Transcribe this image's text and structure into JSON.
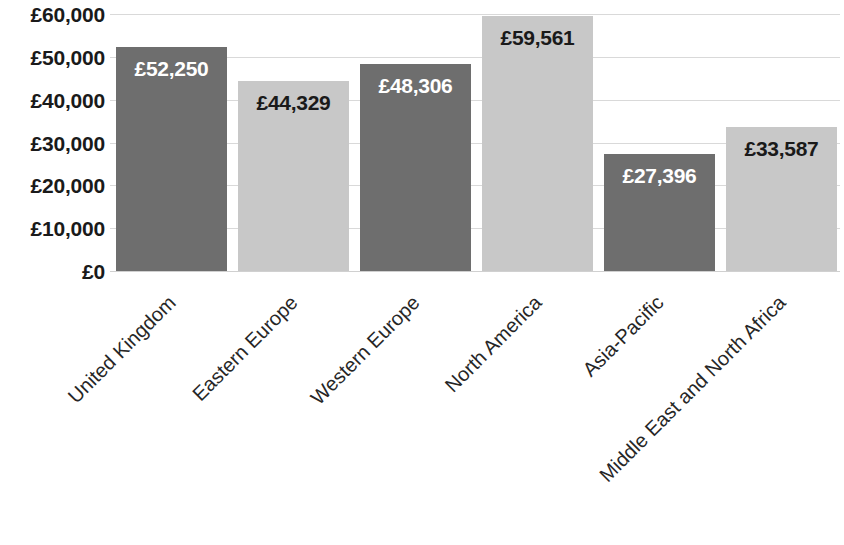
{
  "chart_data": {
    "type": "bar",
    "title": "",
    "subtitle": "",
    "xlabel": "",
    "ylabel": "",
    "categories": [
      "United Kingdom",
      "Eastern Europe",
      "Western Europe",
      "North America",
      "Asia-Pacific",
      "Middle East and North Africa"
    ],
    "values": [
      52250,
      44329,
      48306,
      59561,
      27396,
      33587
    ],
    "value_labels": [
      "£52,250",
      "£44,329",
      "£48,306",
      "£59,561",
      "£27,396",
      "£33,587"
    ],
    "bar_colors": [
      "#6e6e6e",
      "#c8c8c8",
      "#6e6e6e",
      "#c8c8c8",
      "#6e6e6e",
      "#c8c8c8"
    ],
    "label_text_colors": [
      "#ffffff",
      "#1a1a1a",
      "#ffffff",
      "#1a1a1a",
      "#ffffff",
      "#1a1a1a"
    ],
    "ylim": [
      0,
      60000
    ],
    "ytick_values": [
      60000,
      50000,
      40000,
      30000,
      20000,
      10000,
      0
    ],
    "ytick_labels": [
      "£60,000",
      "£50,000",
      "£40,000",
      "£30,000",
      "£20,000",
      "£10,000",
      "£0"
    ],
    "grid": true,
    "grid_color": "#d9d9d9",
    "legend": false,
    "legend_position": "none",
    "background_color": "#ffffff",
    "label_rotation_degrees": -45
  }
}
